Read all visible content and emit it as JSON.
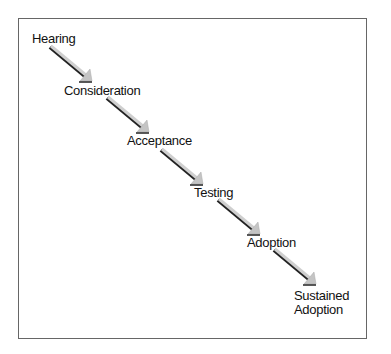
{
  "diagram": {
    "type": "staircase-flow",
    "stages": [
      {
        "label": "Hearing"
      },
      {
        "label": "Consideration"
      },
      {
        "label": "Acceptance"
      },
      {
        "label": "Testing"
      },
      {
        "label": "Adoption"
      },
      {
        "label_line1": "Sustained",
        "label_line2": "Adoption"
      }
    ],
    "colors": {
      "frame": "#666666",
      "arrow_fill": "#c8c8c8",
      "arrow_shadow": "#222222",
      "text": "#111111"
    }
  }
}
